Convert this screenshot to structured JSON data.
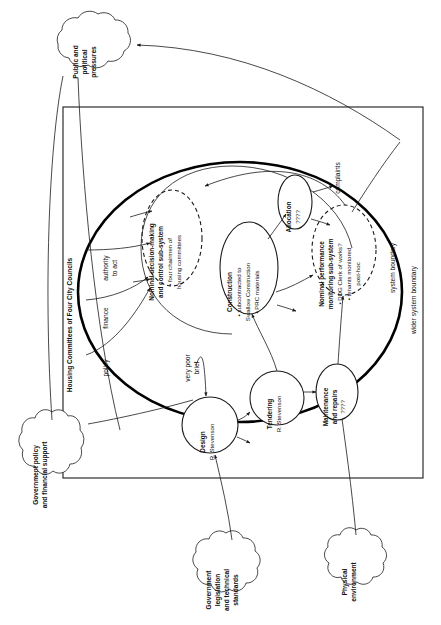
{
  "diagram": {
    "orientation": "rotated-90-ccw",
    "boundaries": {
      "outer_label": "wider system boundary",
      "inner_label": "system boundary",
      "actor_label": "Housing Committees of Four City Councils"
    },
    "clouds": [
      {
        "id": "public",
        "lines": [
          "Public and",
          "political",
          "pressures"
        ]
      },
      {
        "id": "gov-policy",
        "lines": [
          "Government policy",
          "and financial support"
        ]
      },
      {
        "id": "gov-legislation",
        "lines": [
          "Government",
          "legislation",
          "and technical",
          "standards"
        ]
      },
      {
        "id": "physical",
        "lines": [
          "Physical",
          "environment"
        ]
      }
    ],
    "nodes": [
      {
        "id": "decision",
        "shape": "ellipse-dashed",
        "lines": [
          {
            "text": "Nominal decision-making",
            "bold": true
          },
          {
            "text": "and control sub-system",
            "bold": true
          },
          {
            "text": "• four chairmen of",
            "bold": false
          },
          {
            "text": "housing committees",
            "bold": false
          }
        ]
      },
      {
        "id": "monitoring",
        "shape": "ellipse-dashed",
        "lines": [
          {
            "text": "Nominal performance",
            "bold": true
          },
          {
            "text": "monitoring sub-system",
            "bold": true
          },
          {
            "text": "• DDG Clerk of works?",
            "bold": false
          },
          {
            "text": "• tenants monitored",
            "bold": false
          },
          {
            "text": "post-hoc",
            "bold": false
          }
        ]
      },
      {
        "id": "construction",
        "shape": "ellipse",
        "lines": [
          {
            "text": "Construction",
            "bold": true
          },
          {
            "text": "• subcontracted to",
            "bold": false
          },
          {
            "text": "Swallow Construction",
            "bold": false
          },
          {
            "text": "• PRC materials",
            "bold": false
          }
        ]
      },
      {
        "id": "allocation",
        "shape": "ellipse",
        "lines": [
          {
            "text": "Allocation",
            "bold": true
          },
          {
            "text": "????",
            "bold": false
          }
        ]
      },
      {
        "id": "maintenance",
        "shape": "ellipse",
        "lines": [
          {
            "text": "Maintenance",
            "bold": true
          },
          {
            "text": "and repairs",
            "bold": true
          },
          {
            "text": "????",
            "bold": false
          }
        ]
      },
      {
        "id": "design",
        "shape": "circle",
        "lines": [
          {
            "text": "Design",
            "bold": true
          },
          {
            "text": "R. Stevenson",
            "bold": false
          }
        ]
      },
      {
        "id": "tendering",
        "shape": "circle",
        "lines": [
          {
            "text": "Tendering",
            "bold": true
          },
          {
            "text": "R. Stevenson",
            "bold": false
          }
        ]
      }
    ],
    "edge_labels": [
      {
        "id": "authority",
        "lines": [
          "authority",
          "to act"
        ]
      },
      {
        "id": "finance",
        "lines": [
          "finance"
        ]
      },
      {
        "id": "policy",
        "lines": [
          "policy"
        ]
      },
      {
        "id": "complaints",
        "lines": [
          "complaints"
        ]
      },
      {
        "id": "very-poor-brief",
        "lines": [
          "very poor",
          "brief"
        ]
      }
    ],
    "colors": {
      "ink": "#1a1a1a",
      "paper": "#ffffff",
      "boundary": "#000000"
    }
  }
}
